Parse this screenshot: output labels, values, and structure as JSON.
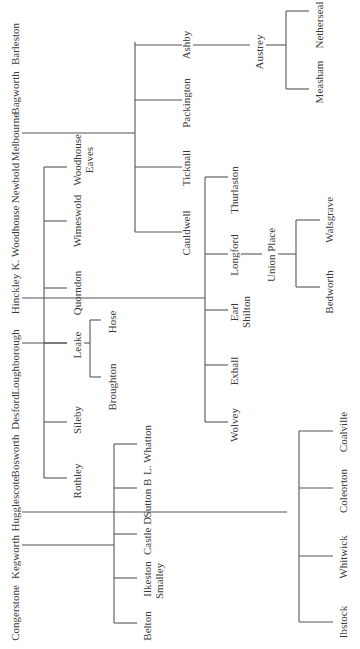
{
  "diagram": {
    "type": "tree",
    "orientation": "rotated-90-ccw",
    "line_color": "#555555",
    "text_color": "#3a3a3a",
    "root_labels": [
      "Barleston",
      "Bagworth",
      "Melbourne",
      "Newbold",
      "K. Woodhouse",
      "Hinckley",
      "Loughborough",
      "Desford",
      "Bosworth",
      "Hugglescote",
      "Kegworth",
      "Congerstone"
    ],
    "branches": {
      "melbourne": {
        "parent": "Melbourne",
        "children": [
          "Ashby",
          "Packington",
          "Ticknall",
          "Cauldwell"
        ],
        "ashby_child": "Austrey",
        "austrey_children": [
          "Netherseal",
          "Measham"
        ]
      },
      "loughborough": {
        "parent": "Loughborough",
        "children": [
          "Woodhouse Eaves",
          "Wimeswold",
          "Quorndon",
          "Leake",
          "Sileby",
          "Rothley"
        ],
        "leake_children": [
          "Hose",
          "Broughton"
        ]
      },
      "hinckley": {
        "parent": "Hinckley",
        "children": [
          "Thurlaston",
          "Longford",
          "Earl Shilton",
          "Exhall",
          "Wolvey"
        ],
        "longford_child": "Union Place",
        "union_place_children": [
          "Walsgrave",
          "Bedworth"
        ]
      },
      "kegworth": {
        "parent": "Kegworth",
        "children": [
          "L. Whatton",
          "Sutton B",
          "Castle D",
          "Ilkeston Smalley",
          "Belton"
        ]
      },
      "hugglescote": {
        "parent": "Hugglescote",
        "children": [
          "Coalville",
          "Coleorton",
          "Whitwick",
          "Ibstock"
        ]
      }
    },
    "labels": {
      "ashby": "Ashby",
      "packington": "Packington",
      "ticknall": "Ticknall",
      "cauldwell": "Cauldwell",
      "austrey": "Austrey",
      "netherseal": "Netherseal",
      "measham": "Measham",
      "woodhouse_eaves_1": "Woodhouse",
      "woodhouse_eaves_2": "Eaves",
      "wimeswold": "Wimeswold",
      "quorndon": "Quorndon",
      "leake": "Leake",
      "hose": "Hose",
      "broughton": "Broughton",
      "sileby": "Sileby",
      "rothley": "Rothley",
      "thurlaston": "Thurlaston",
      "longford": "Longford",
      "union_place": "Union Place",
      "walsgrave": "Walsgrave",
      "bedworth": "Bedworth",
      "earl_shilton_1": "Earl",
      "earl_shilton_2": "Shilton",
      "exhall": "Exhall",
      "wolvey": "Wolvey",
      "l_whatton": "L. Whatton",
      "sutton_b": "Sutton B",
      "castle_d": "Castle D",
      "ilkeston": "Ilkeston",
      "smalley": "Smalley",
      "belton": "Belton",
      "coalville": "Coalville",
      "coleorton": "Coleorton",
      "whitwick": "Whitwick",
      "ibstock": "Ibstock"
    }
  }
}
